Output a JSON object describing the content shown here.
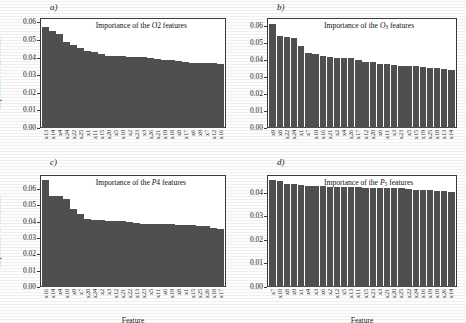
{
  "figure": {
    "background": "#fdfdfd",
    "bar_color": "#4f4f4f",
    "axis_color": "#3a3a3a",
    "ylabel": "Importance of the feature",
    "xlabel": "Feature"
  },
  "panels": [
    {
      "tag": "a)",
      "title_prefix": "Importance of the ",
      "title_symbol": "O",
      "title_sub": "2",
      "title_suffix": " features",
      "ylabel": "Importance of the feature",
      "xlabel": "",
      "yticks": [
        "0.00",
        "0.01",
        "0.02",
        "0.03",
        "0.04",
        "0.05",
        "0.06"
      ],
      "ylim": [
        0,
        0.0625
      ]
    },
    {
      "tag": "b)",
      "title_prefix": "Importance of the ",
      "title_symbol": "O",
      "title_sub": "3",
      "title_suffix": " features",
      "ylabel": "",
      "xlabel": "",
      "yticks": [
        "0.00",
        "0.01",
        "0.02",
        "0.03",
        "0.04",
        "0.05",
        "0.06"
      ],
      "ylim": [
        0,
        0.0645
      ]
    },
    {
      "tag": "c)",
      "title_prefix": "Importance of the ",
      "title_symbol": "P",
      "title_sub": "4",
      "title_suffix": " features",
      "ylabel": "Importance of the feature",
      "xlabel": "Feature",
      "yticks": [
        "0.00",
        "0.01",
        "0.02",
        "0.03",
        "0.04",
        "0.05",
        "0.06"
      ],
      "ylim": [
        0,
        0.0685
      ]
    },
    {
      "tag": "d)",
      "title_prefix": "Importance of the ",
      "title_symbol": "P",
      "title_sub": "5",
      "title_suffix": " features",
      "ylabel": "",
      "xlabel": "Feature",
      "yticks": [
        "0.00",
        "0.01",
        "0.02",
        "0.03",
        "0.04"
      ],
      "ylim": [
        0,
        0.0475
      ]
    }
  ],
  "chart_data": [
    {
      "type": "bar",
      "panel": "a)",
      "title": "Importance of the O2 features",
      "xlabel": "Feature",
      "ylabel": "Importance of the feature",
      "ylim": [
        0,
        0.0625
      ],
      "yticks": [
        0.0,
        0.01,
        0.02,
        0.03,
        0.04,
        0.05,
        0.06
      ],
      "grid": false,
      "categories": [
        "x13",
        "x14",
        "x4",
        "x24",
        "x22",
        "x25",
        "x1",
        "x11",
        "x15",
        "x20",
        "x5",
        "x10",
        "x2",
        "x23",
        "x3",
        "x26",
        "x21",
        "x19",
        "x18",
        "x8",
        "x17",
        "x6",
        "x9",
        "x7",
        "x12",
        "x16"
      ],
      "values": [
        0.0575,
        0.0549,
        0.0534,
        0.0487,
        0.0474,
        0.0453,
        0.044,
        0.0434,
        0.0423,
        0.0411,
        0.0408,
        0.0407,
        0.0405,
        0.0404,
        0.0403,
        0.0399,
        0.0392,
        0.0389,
        0.0387,
        0.0383,
        0.0374,
        0.0372,
        0.0371,
        0.037,
        0.0369,
        0.0366
      ]
    },
    {
      "type": "bar",
      "panel": "b)",
      "title": "Importance of the O3 features",
      "xlabel": "Feature",
      "ylabel": "Importance of the feature",
      "ylim": [
        0,
        0.0645
      ],
      "yticks": [
        0.0,
        0.01,
        0.02,
        0.03,
        0.04,
        0.05,
        0.06
      ],
      "grid": false,
      "categories": [
        "x9",
        "x8",
        "x22",
        "x24",
        "x1",
        "x7",
        "x10",
        "x16",
        "x21",
        "x2",
        "x4",
        "x26",
        "x17",
        "x12",
        "x20",
        "x6",
        "x11",
        "x3",
        "x23",
        "x5",
        "x15",
        "x19",
        "x25",
        "x18",
        "x13",
        "x14"
      ],
      "values": [
        0.061,
        0.0539,
        0.0534,
        0.0528,
        0.0482,
        0.0439,
        0.0433,
        0.0424,
        0.0418,
        0.0413,
        0.0411,
        0.041,
        0.0396,
        0.0388,
        0.0386,
        0.0375,
        0.0373,
        0.0369,
        0.0365,
        0.0363,
        0.0362,
        0.0359,
        0.0352,
        0.0349,
        0.0344,
        0.0342
      ]
    },
    {
      "type": "bar",
      "panel": "c)",
      "title": "Importance of the P4 features",
      "xlabel": "Feature",
      "ylabel": "Importance of the feature",
      "ylim": [
        0,
        0.0685
      ],
      "yticks": [
        0.0,
        0.01,
        0.02,
        0.03,
        0.04,
        0.05,
        0.06
      ],
      "grid": false,
      "categories": [
        "x16",
        "x14",
        "x4",
        "x10",
        "x9",
        "x7",
        "x20",
        "x24",
        "x2",
        "x3",
        "x12",
        "x21",
        "x22",
        "x13",
        "x23",
        "x5",
        "x11",
        "x6",
        "x19",
        "x8",
        "x1",
        "x15",
        "x25",
        "x26",
        "x18",
        "x17"
      ],
      "values": [
        0.0655,
        0.0559,
        0.0557,
        0.0538,
        0.048,
        0.0447,
        0.0415,
        0.041,
        0.0407,
        0.0405,
        0.0404,
        0.0402,
        0.0399,
        0.0391,
        0.0388,
        0.0387,
        0.0385,
        0.0384,
        0.0383,
        0.0382,
        0.038,
        0.0378,
        0.0376,
        0.0373,
        0.0362,
        0.0355
      ]
    },
    {
      "type": "bar",
      "panel": "d)",
      "title": "Importance of the P5 features",
      "xlabel": "Feature",
      "ylabel": "Importance of the feature",
      "ylim": [
        0,
        0.0475
      ],
      "yticks": [
        0.0,
        0.01,
        0.02,
        0.03,
        0.04
      ],
      "grid": false,
      "categories": [
        "x7",
        "x10",
        "x8",
        "x9",
        "x1",
        "x4",
        "x3",
        "x6",
        "x2",
        "x12",
        "x5",
        "x13",
        "x11",
        "x15",
        "x23",
        "x3",
        "x21",
        "x20",
        "x25",
        "x22",
        "x24",
        "x16",
        "x19",
        "x18",
        "x26",
        "x14"
      ],
      "values": [
        0.0455,
        0.045,
        0.0438,
        0.0435,
        0.0432,
        0.043,
        0.0428,
        0.0427,
        0.0426,
        0.0425,
        0.0424,
        0.0424,
        0.0423,
        0.0422,
        0.0422,
        0.0421,
        0.042,
        0.0419,
        0.0418,
        0.0414,
        0.0412,
        0.0411,
        0.041,
        0.0409,
        0.0408,
        0.0405
      ]
    }
  ]
}
